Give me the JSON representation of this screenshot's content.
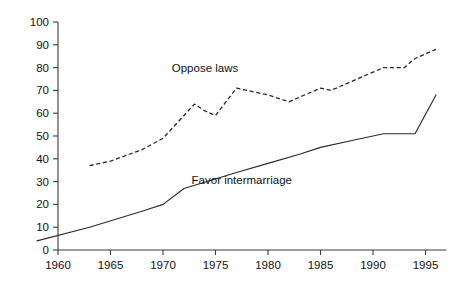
{
  "chart_data": {
    "type": "line",
    "title": "",
    "xlabel": "",
    "ylabel": "",
    "xlim": [
      1958,
      1997
    ],
    "ylim": [
      0,
      100
    ],
    "grid": false,
    "legend_position": "inline-annotations",
    "y_ticks": [
      0,
      10,
      20,
      30,
      40,
      50,
      60,
      70,
      80,
      90,
      100
    ],
    "y_tick_labels": [
      "0",
      "10",
      "20",
      "30",
      "40",
      "50",
      "60",
      "70",
      "80",
      "90",
      "100"
    ],
    "x_ticks": [
      1960,
      1965,
      1970,
      1975,
      1980,
      1985,
      1990,
      1995
    ],
    "x_tick_labels": [
      "1960",
      "1965",
      "1970",
      "1975",
      "1980",
      "1985",
      "1990",
      "1995"
    ],
    "series": [
      {
        "name": "Oppose laws",
        "style": "dashed",
        "color": "#2b2b2b",
        "label_x": 1974.0,
        "label_y": 78,
        "x": [
          1963,
          1965,
          1968,
          1970,
          1972,
          1973,
          1974,
          1975,
          1977,
          1980,
          1982,
          1983,
          1985,
          1986,
          1988,
          1990,
          1991,
          1993,
          1994,
          1996
        ],
        "values": [
          37,
          39,
          44,
          49,
          59,
          64,
          61,
          59,
          71,
          68,
          65,
          67,
          71,
          70,
          74,
          78,
          80,
          80,
          84,
          88
        ]
      },
      {
        "name": "Favor intermarriage",
        "style": "solid",
        "color": "#2b2b2b",
        "label_x": 1977.5,
        "label_y": 29,
        "x": [
          1958,
          1963,
          1968,
          1970,
          1972,
          1977,
          1980,
          1983,
          1985,
          1988,
          1991,
          1994,
          1996
        ],
        "values": [
          4,
          10,
          17,
          20,
          27,
          34,
          38,
          42,
          45,
          48,
          51,
          51,
          68
        ]
      }
    ],
    "annotations": [
      {
        "text": "Oppose laws",
        "series": "Oppose laws"
      },
      {
        "text": "Favor intermarriage",
        "series": "Favor intermarriage"
      }
    ]
  }
}
